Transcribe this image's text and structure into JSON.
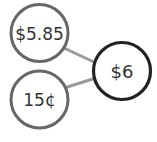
{
  "diagram": {
    "type": "number-bond",
    "whole": {
      "label": "$6",
      "stroke": "#222222"
    },
    "parts": [
      {
        "label": "$5.85",
        "stroke": "#666666"
      },
      {
        "label": "15¢",
        "stroke": "#666666"
      }
    ],
    "connector_color": "#9a9a9a"
  }
}
